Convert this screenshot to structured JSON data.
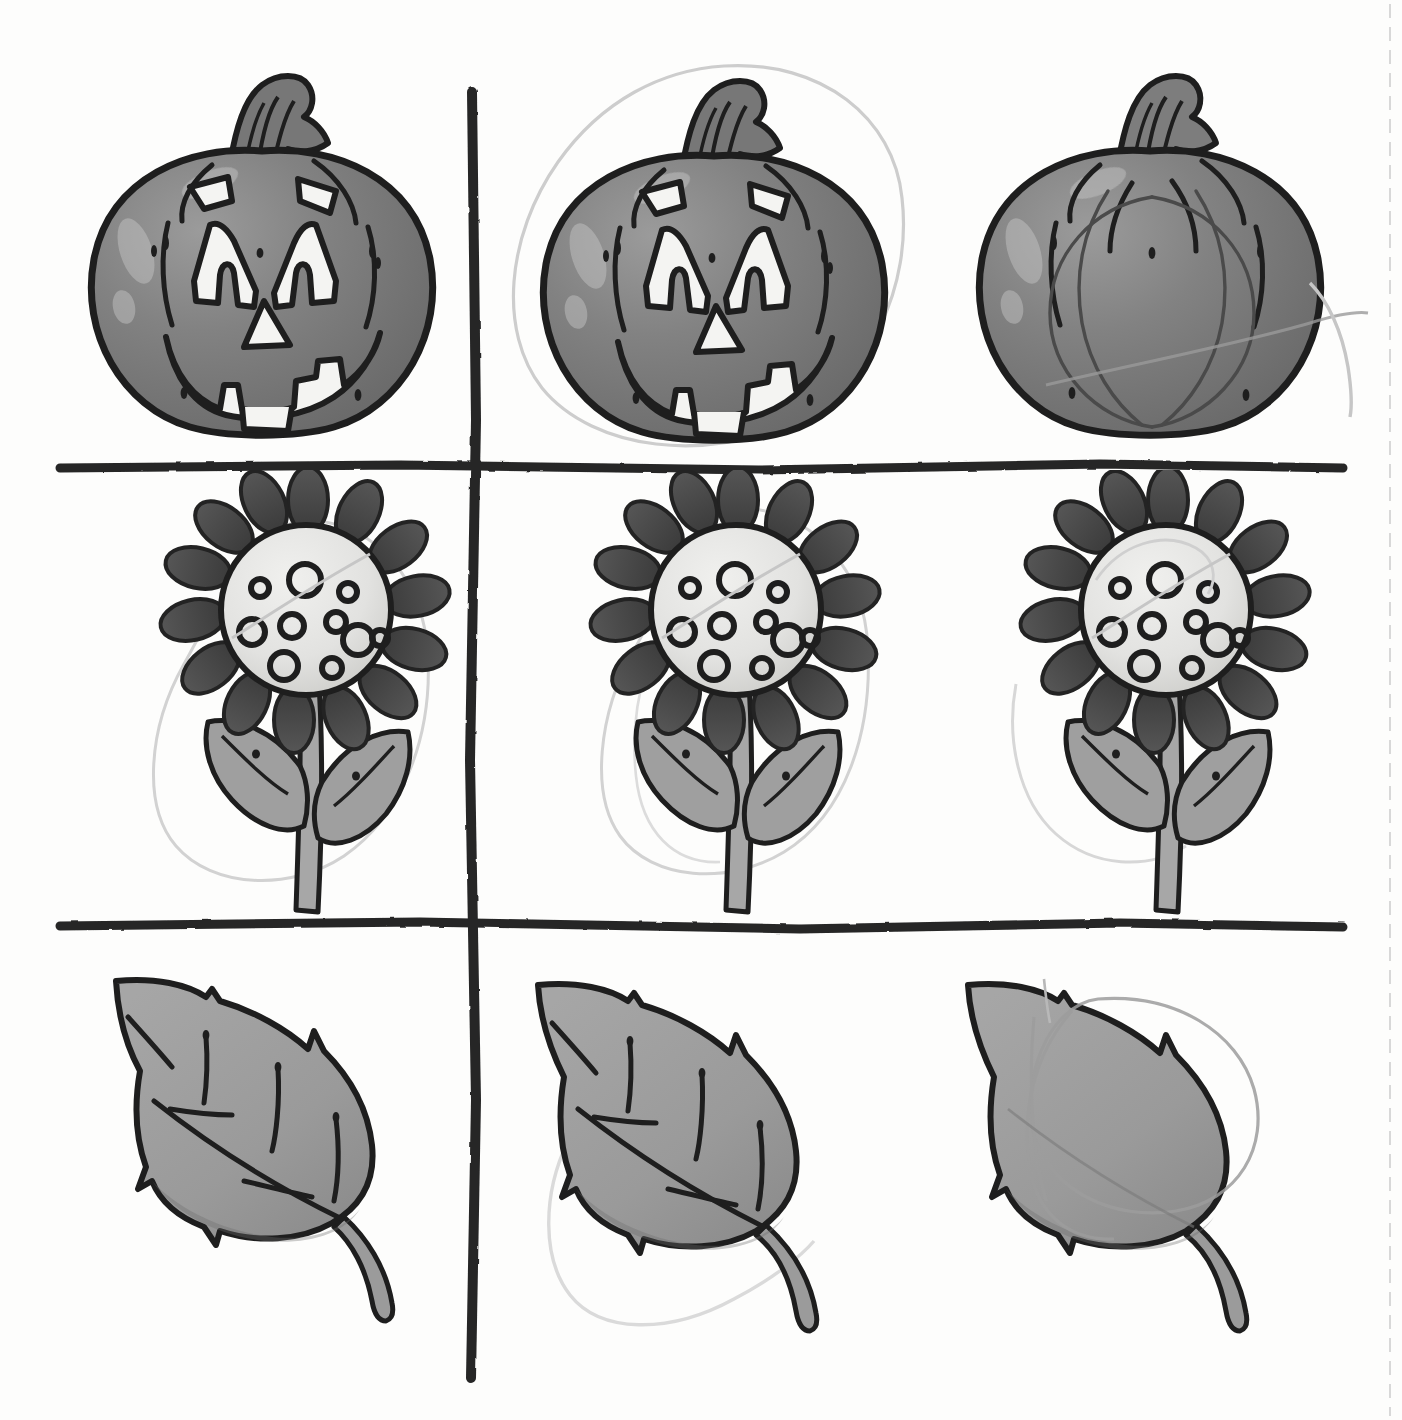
{
  "worksheet": {
    "title": "Hand-drawn worksheet grid with fall clip-art",
    "description": "Scanned paper sheet divided by thick hand-drawn black lines into a 3-row by 3-column arrangement of grayscale clip-art: jack-o'-lantern pumpkins, sunflowers and leaves. Several pictures have faint pencil circles drawn around them.",
    "paper_color": "#fdfdfc",
    "ink_color": "#1a1a1a",
    "pencil_color": "#c8c8c8"
  },
  "grid": {
    "name": "hand-drawn-grid",
    "line_color": "#262626",
    "columns": 3,
    "rows": 3,
    "lines": [
      {
        "id": "h1",
        "orientation": "horizontal",
        "y": 467,
        "x_start": 60,
        "x_end": 1343,
        "thickness": 9
      },
      {
        "id": "h2",
        "orientation": "horizontal",
        "y": 925,
        "x_start": 60,
        "x_end": 1343,
        "thickness": 9
      },
      {
        "id": "v1",
        "orientation": "vertical",
        "x": 473,
        "y_start": 92,
        "y_end": 1378,
        "thickness": 10
      }
    ],
    "fold_line": {
      "id": "perforation",
      "orientation": "vertical",
      "x": 1390,
      "style": "dashed",
      "color": "#d8d8d8"
    }
  },
  "palette": {
    "pumpkin_body": "#7b7b7b",
    "pumpkin_shadow": "#5f5f5f",
    "pumpkin_highlight": "#9a9a9a",
    "pumpkin_stem": "#6f6f6f",
    "pumpkin_stem_light": "#8d8d8d",
    "face_cut": "#f4f4f2",
    "petal_dark": "#4a4a4a",
    "petal_shadow": "#3a3a3a",
    "seed_disc": "#e8e8e6",
    "seed_disc_shadow": "#cfcfcd",
    "seed_ring": "#1e1e1e",
    "leaf_body": "#9d9d9d",
    "leaf_shadow": "#888888",
    "stem_green": "#a5a5a5",
    "outline": "#1e1e1e",
    "pencil": "#cbcbcb"
  },
  "cells": [
    {
      "id": "r1c1",
      "row": 1,
      "col": 1,
      "subject": "jack-o-lantern-pumpkin",
      "label": "Jack-o'-lantern with carved face",
      "has_face": true,
      "pencil_mark": "none",
      "x": 62,
      "y": 55,
      "w": 400,
      "h": 400
    },
    {
      "id": "r1c2",
      "row": 1,
      "col": 2,
      "subject": "jack-o-lantern-pumpkin",
      "label": "Jack-o'-lantern with carved face, circled in pencil",
      "has_face": true,
      "pencil_mark": "circle",
      "x": 512,
      "y": 55,
      "w": 400,
      "h": 400
    },
    {
      "id": "r1c3",
      "row": 1,
      "col": 3,
      "subject": "plain-pumpkin",
      "label": "Plain uncarved pumpkin with ribs, pencil line across",
      "has_face": false,
      "pencil_mark": "stroke",
      "x": 955,
      "y": 55,
      "w": 400,
      "h": 400
    },
    {
      "id": "r2c1",
      "row": 2,
      "col": 1,
      "subject": "sunflower",
      "label": "Sunflower with stem and two leaves, circled in pencil",
      "pencil_mark": "oval",
      "x": 145,
      "y": 475,
      "w": 310,
      "h": 430
    },
    {
      "id": "r2c2",
      "row": 2,
      "col": 2,
      "subject": "sunflower",
      "label": "Sunflower with stem and two leaves, circled in pencil",
      "pencil_mark": "oval",
      "x": 575,
      "y": 475,
      "w": 310,
      "h": 430
    },
    {
      "id": "r2c3",
      "row": 2,
      "col": 3,
      "subject": "sunflower",
      "label": "Sunflower with stem and two leaves, faint pencil arc",
      "pencil_mark": "arc",
      "x": 1005,
      "y": 475,
      "w": 310,
      "h": 430
    },
    {
      "id": "r3c1",
      "row": 3,
      "col": 1,
      "subject": "leaf",
      "label": "Leaf with midrib and side veins",
      "has_veins": true,
      "pencil_mark": "none",
      "x": 92,
      "y": 955,
      "w": 360,
      "h": 360
    },
    {
      "id": "r3c2",
      "row": 3,
      "col": 2,
      "subject": "leaf",
      "label": "Leaf with midrib and side veins, pencil arc below",
      "has_veins": true,
      "pencil_mark": "arc",
      "x": 512,
      "y": 955,
      "w": 360,
      "h": 360
    },
    {
      "id": "r3c3",
      "row": 3,
      "col": 3,
      "subject": "leaf",
      "label": "Leaf without veins, large pencil oval drawn over it",
      "has_veins": false,
      "pencil_mark": "oval",
      "x": 942,
      "y": 955,
      "w": 360,
      "h": 360
    }
  ],
  "chart_data": {
    "type": "table",
    "categories": [
      "column 1",
      "column 2",
      "column 3"
    ],
    "rows": [
      "pumpkins",
      "sunflowers",
      "leaves"
    ],
    "values": [
      [
        "jack-o-lantern",
        "jack-o-lantern (circled)",
        "plain pumpkin (pencil stroke)"
      ],
      [
        "sunflower (circled)",
        "sunflower (circled)",
        "sunflower (pencil arc)"
      ],
      [
        "leaf with veins",
        "leaf with veins (pencil arc)",
        "leaf no veins (pencil oval)"
      ]
    ]
  }
}
